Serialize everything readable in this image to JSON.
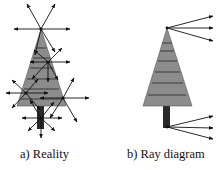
{
  "figure": {
    "panels": [
      {
        "id": "a",
        "caption": "a) Reality",
        "description": "Tree with rays scattering in all directions from many surface points"
      },
      {
        "id": "b",
        "caption": "b) Ray diagram",
        "description": "Tree with only a few rays drawn from the top and bottom points"
      }
    ]
  },
  "colors": {
    "foliage": "#8c8c8c",
    "trunk": "#2a2a2a",
    "ray": "#111111",
    "stripe": "#3a3a3a"
  }
}
